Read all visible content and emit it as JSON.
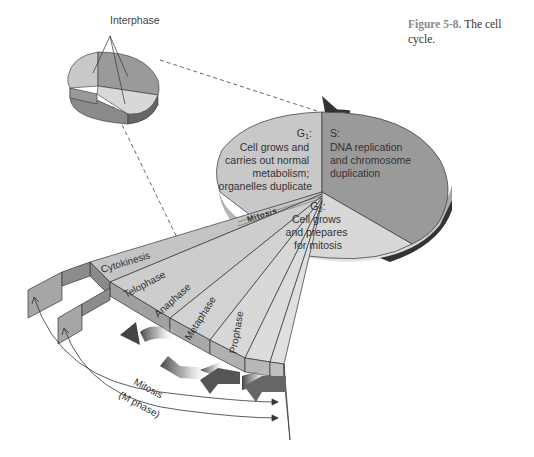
{
  "caption": {
    "figure_number": "Figure 5-8.",
    "title": "The cell cycle."
  },
  "small_pie": {
    "label": "Interphase"
  },
  "large_pie": {
    "g1": {
      "heading": "G",
      "subscript": "1",
      "suffix": ":",
      "lines": [
        "Cell grows and",
        "carries out normal",
        "metabolism;",
        "organelles duplicate"
      ]
    },
    "s": {
      "heading": "S:",
      "lines": [
        "DNA replication",
        "and chromosome",
        "duplication"
      ]
    },
    "g2": {
      "heading": "G",
      "subscript": "2",
      "suffix": ":",
      "lines": [
        "Cell grows",
        "and prepares",
        "for mitosis"
      ]
    },
    "mitosis_label": "Mitosis"
  },
  "mitosis_fan": {
    "phases": [
      "Cytokinesis",
      "Telophase",
      "Anaphase",
      "Metaphase",
      "Prophase"
    ]
  },
  "bracket": {
    "line1": "Mitosis",
    "line2": "(M phase)"
  },
  "colors": {
    "g1": "#c8c8c8",
    "s": "#9a9a9a",
    "g2": "#d8d8d8",
    "side": "#8c8c8c",
    "arrow": "#555555"
  }
}
